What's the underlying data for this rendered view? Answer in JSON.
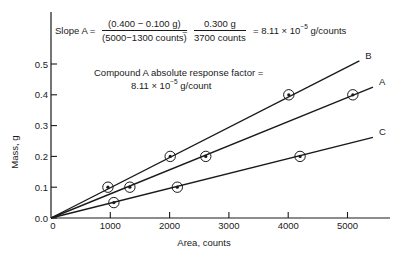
{
  "chart_data": {
    "type": "line",
    "title": "",
    "xlabel": "Area, counts",
    "ylabel": "Mass, g",
    "xlim": [
      0,
      5700
    ],
    "ylim": [
      0,
      0.55
    ],
    "x_ticks": [
      0,
      1000,
      2000,
      3000,
      4000,
      5000
    ],
    "x_tick_labels": [
      "0",
      "1000",
      "2000",
      "3000",
      "4000",
      "5000"
    ],
    "y_ticks": [
      0.0,
      0.1,
      0.2,
      0.3,
      0.4,
      0.5
    ],
    "y_tick_labels": [
      "0.0",
      "0.1",
      "0.2",
      "0.3",
      "0.4",
      "0.5"
    ],
    "grid": false,
    "legend": "inline labels at line ends",
    "series": [
      {
        "name": "B",
        "points": [
          {
            "x": 960,
            "y": 0.1
          },
          {
            "x": 2010,
            "y": 0.2
          },
          {
            "x": 4010,
            "y": 0.4
          }
        ],
        "line": {
          "from": [
            0,
            0
          ],
          "to": [
            5200,
            0.51
          ]
        }
      },
      {
        "name": "A",
        "points": [
          {
            "x": 1330,
            "y": 0.1
          },
          {
            "x": 2610,
            "y": 0.2
          },
          {
            "x": 5090,
            "y": 0.4
          }
        ],
        "line": {
          "from": [
            0,
            0
          ],
          "to": [
            5430,
            0.425
          ]
        }
      },
      {
        "name": "C",
        "points": [
          {
            "x": 1060,
            "y": 0.05
          },
          {
            "x": 2130,
            "y": 0.1
          },
          {
            "x": 4200,
            "y": 0.2
          }
        ],
        "line": {
          "from": [
            0,
            0
          ],
          "to": [
            5430,
            0.262
          ]
        }
      }
    ],
    "annotations": [
      "Slope A = (0.400 − 0.100 g) / (5000−1300 counts) = 0.300 g / 3700 counts = 8.11 × 10^-5 g/counts",
      "Compound A absolute response factor = 8.11 × 10^-5 g/count"
    ]
  },
  "equation": {
    "lhs": "Slope A =",
    "frac1_num": "(0.400 − 0.100 g)",
    "frac1_den": "(5000−1300 counts)",
    "eq2": "=",
    "frac2_num": "0.300 g",
    "frac2_den": "3700 counts",
    "result_prefix": "= 8.11 × 10",
    "result_exp": "−5",
    "result_unit": " g/counts"
  },
  "note": {
    "line1": "Compound A absolute response factor  =",
    "line2_prefix": "8.11 × 10",
    "line2_exp": "−5",
    "line2_unit": " g/count"
  },
  "colors": {
    "ink": "#1a1a1a",
    "background": "#ffffff"
  }
}
